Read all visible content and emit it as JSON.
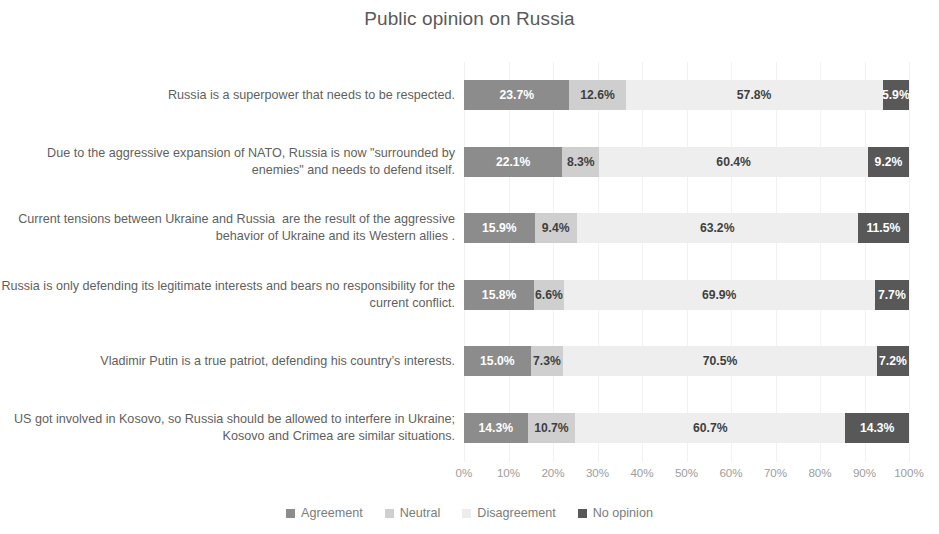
{
  "chart_data": {
    "type": "bar",
    "subtype": "stacked-horizontal-100",
    "title": "Public opinion on Russia",
    "xlabel": "",
    "ylabel": "",
    "xlim": [
      0,
      100
    ],
    "xticks": [
      "0%",
      "10%",
      "20%",
      "30%",
      "40%",
      "50%",
      "60%",
      "70%",
      "80%",
      "90%",
      "100%"
    ],
    "grid": true,
    "legend_position": "bottom",
    "categories": [
      "Russia is a superpower that needs to be respected.",
      "Due to the aggressive expansion of NATO, Russia is now \"surrounded by enemies\" and needs to defend itself.",
      "Current tensions between Ukraine and Russia  are the result of the aggressive behavior of Ukraine and its Western allies .",
      "Russia is only defending its legitimate interests and bears no responsibility for the current conflict.",
      "Vladimir Putin is a true patriot, defending his country’s interests.",
      "US got involved in Kosovo, so Russia should be allowed to interfere in Ukraine; Kosovo and Crimea are similar situations."
    ],
    "series": [
      {
        "name": "Agreement",
        "color": "#8c8c8c",
        "values": [
          23.7,
          22.1,
          15.9,
          15.8,
          15.0,
          14.3
        ]
      },
      {
        "name": "Neutral",
        "color": "#cfcfcf",
        "values": [
          12.6,
          8.3,
          9.4,
          6.6,
          7.3,
          10.7
        ]
      },
      {
        "name": "Disagreement",
        "color": "#eeeeee",
        "values": [
          57.8,
          60.4,
          63.2,
          69.9,
          70.5,
          60.7
        ]
      },
      {
        "name": "No opinion",
        "color": "#585858",
        "values": [
          5.9,
          9.2,
          11.5,
          7.7,
          7.2,
          14.3
        ]
      }
    ],
    "data_labels": [
      [
        "23.7%",
        "12.6%",
        "57.8%",
        "5.9%"
      ],
      [
        "22.1%",
        "8.3%",
        "60.4%",
        "9.2%"
      ],
      [
        "15.9%",
        "9.4%",
        "63.2%",
        "11.5%"
      ],
      [
        "15.8%",
        "6.6%",
        "69.9%",
        "7.7%"
      ],
      [
        "15.0%",
        "7.3%",
        "70.5%",
        "7.2%"
      ],
      [
        "14.3%",
        "10.7%",
        "60.7%",
        "14.3%"
      ]
    ]
  }
}
